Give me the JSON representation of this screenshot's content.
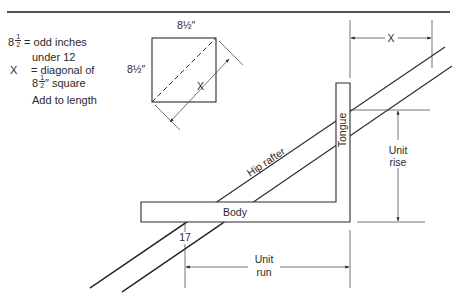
{
  "figure": {
    "legend": {
      "line1_value": "8",
      "line1_frac_num": "1",
      "line1_frac_den": "2",
      "line1_text": "= odd inches",
      "line2_text": "under 12",
      "line3_symbol": "X",
      "line3_text": "= diagonal of",
      "line4_value": "8",
      "line4_frac_num": "1",
      "line4_frac_den": "2",
      "line4_text": "″ square",
      "line5_text": "Add to length"
    },
    "square": {
      "top_label": "8½″",
      "side_label": "8½″",
      "diagonal_label": "X"
    },
    "framing_square": {
      "body_label": "Body",
      "tongue_label": "Tongue"
    },
    "rafter_label": "Hip rafter",
    "mark_label": "17",
    "dimensions": {
      "top_x_label": "X",
      "unit_rise_line1": "Unit",
      "unit_rise_line2": "rise",
      "unit_run_line1": "Unit",
      "unit_run_line2": "run"
    }
  }
}
